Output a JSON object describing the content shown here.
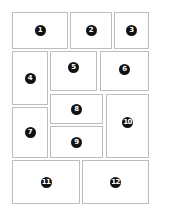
{
  "diagram": {
    "title": "",
    "panels": [
      {
        "label": "1",
        "x": 12,
        "y": 12,
        "w": 56,
        "h": 37
      },
      {
        "label": "2",
        "x": 70,
        "y": 12,
        "w": 42,
        "h": 37
      },
      {
        "label": "3",
        "x": 114,
        "y": 12,
        "w": 35,
        "h": 37
      },
      {
        "label": "4",
        "x": 12,
        "y": 51,
        "w": 36,
        "h": 54
      },
      {
        "label": "5",
        "x": 50,
        "y": 51,
        "w": 47,
        "h": 40
      },
      {
        "label": "6",
        "x": 100,
        "y": 51,
        "w": 49,
        "h": 40
      },
      {
        "label": "7",
        "x": 12,
        "y": 107,
        "w": 36,
        "h": 51
      },
      {
        "label": "8",
        "x": 50,
        "y": 94,
        "w": 53,
        "h": 30
      },
      {
        "label": "9",
        "x": 50,
        "y": 126,
        "w": 53,
        "h": 32
      },
      {
        "label": "10",
        "x": 106,
        "y": 94,
        "w": 43,
        "h": 64
      },
      {
        "label": "11",
        "x": 12,
        "y": 160,
        "w": 68,
        "h": 44
      },
      {
        "label": "12",
        "x": 82,
        "y": 160,
        "w": 67,
        "h": 44
      }
    ]
  }
}
